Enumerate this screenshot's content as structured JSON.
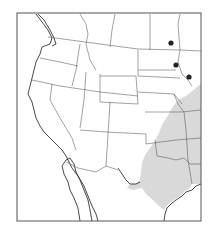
{
  "map": {
    "type": "species range map",
    "region": "Western and Central United States and northern Mexico",
    "frame": {
      "x": 17,
      "y": 13,
      "width": 184,
      "height": 208
    },
    "colors": {
      "background": "#ffffff",
      "range_fill": "#d9d9d9",
      "borders": "#555555",
      "coastline": "#333333",
      "record_dots": "#222222"
    },
    "legend": {
      "range_area": "shaded region (central/southern Great Plains to Texas)",
      "isolated_records": "black dots (Minnesota / North Dakota area)"
    },
    "records": [
      {
        "id": "record-1",
        "x": 171,
        "y": 43
      },
      {
        "id": "record-2",
        "x": 176,
        "y": 65
      },
      {
        "id": "record-3",
        "x": 189,
        "y": 77
      }
    ]
  }
}
